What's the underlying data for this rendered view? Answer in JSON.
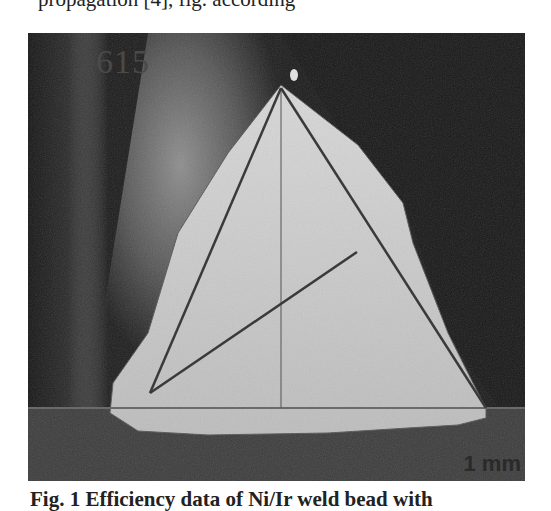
{
  "page": {
    "top_text_clipped": "propagation [4], fig. according",
    "caption_clipped": "Fig. 1 Efficiency data of Ni/Ir weld bead with"
  },
  "figure": {
    "sample_label": "615",
    "scale_bar_label": "1 mm",
    "colors": {
      "background_dark": "#1c1c1c",
      "weld_bright": "#c8c8c8",
      "heat_affected": "#6e6e6e",
      "annotation_lines": "#3a3a3a",
      "horizontal_line": "#707070"
    }
  }
}
